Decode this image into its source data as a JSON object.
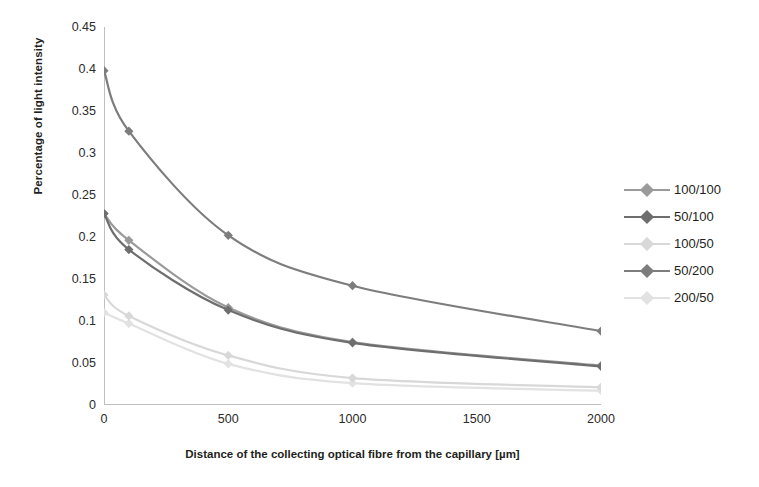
{
  "chart_data": {
    "type": "line",
    "title": "",
    "xlabel": "Distance of the collecting optical fibre from the capillary [µm]",
    "ylabel": "Percentage of light intensity",
    "x": [
      0,
      100,
      500,
      1000,
      2000
    ],
    "xlim": [
      0,
      2000
    ],
    "ylim": [
      0,
      0.45
    ],
    "xticks": [
      "0",
      "500",
      "1000",
      "1500",
      "2000"
    ],
    "xtick_values": [
      0,
      500,
      1000,
      1500,
      2000
    ],
    "yticks": [
      "0",
      "0.05",
      "0.1",
      "0.15",
      "0.2",
      "0.25",
      "0.3",
      "0.35",
      "0.4",
      "0.45"
    ],
    "ytick_values": [
      0,
      0.05,
      0.1,
      0.15,
      0.2,
      0.25,
      0.3,
      0.35,
      0.4,
      0.45
    ],
    "grid": false,
    "legend_position": "right",
    "marker": "diamond",
    "series": [
      {
        "name": "100/100",
        "color": "#9a9a9a",
        "values": [
          0.228,
          0.196,
          0.116,
          0.075,
          0.047
        ]
      },
      {
        "name": "50/100",
        "color": "#6e6e6e",
        "values": [
          0.228,
          0.185,
          0.113,
          0.074,
          0.046
        ]
      },
      {
        "name": "100/50",
        "color": "#d8d8d8",
        "values": [
          0.131,
          0.106,
          0.059,
          0.032,
          0.021
        ]
      },
      {
        "name": "50/200",
        "color": "#7d7d7d",
        "values": [
          0.398,
          0.326,
          0.202,
          0.142,
          0.088
        ]
      },
      {
        "name": "200/50",
        "color": "#e2e2e2",
        "values": [
          0.11,
          0.097,
          0.049,
          0.026,
          0.017
        ]
      }
    ]
  },
  "axes": {
    "axis_line_color": "#bfbfbf",
    "text_color": "#231f20"
  }
}
